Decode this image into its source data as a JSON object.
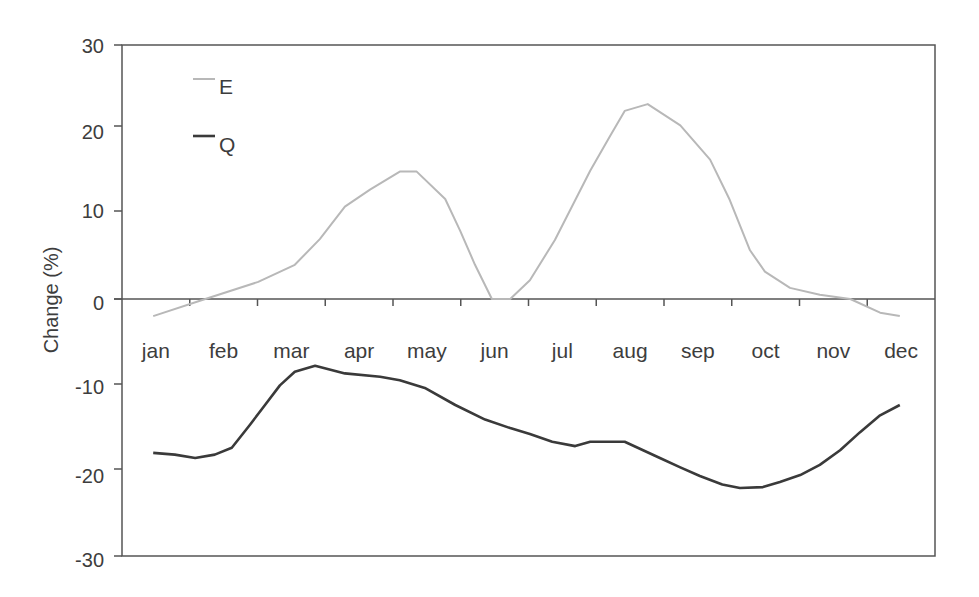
{
  "chart_data": {
    "type": "line",
    "title": "",
    "xlabel": "",
    "ylabel": "Change (%)",
    "ylim": [
      -30,
      30
    ],
    "yticks": [
      30,
      20,
      10,
      0,
      -10,
      -20,
      -30
    ],
    "categories": [
      "jan",
      "feb",
      "mar",
      "apr",
      "may",
      "jun",
      "jul",
      "aug",
      "sep",
      "oct",
      "nov",
      "dec"
    ],
    "x_unit": "month index (0 = start of jan, 12 = end of dec)",
    "xlim": [
      0,
      12
    ],
    "grid": false,
    "legend_position": "upper-left inside plot",
    "series": [
      {
        "name": "E",
        "color": "#b8b8b8",
        "x": [
          0.46,
          1.23,
          2.01,
          2.55,
          2.92,
          3.29,
          3.66,
          4.1,
          4.35,
          4.77,
          4.99,
          5.21,
          5.46,
          5.73,
          6.02,
          6.39,
          6.91,
          7.2,
          7.42,
          7.76,
          8.24,
          8.68,
          8.97,
          9.27,
          9.49,
          9.86,
          10.3,
          10.75,
          11.19,
          11.48
        ],
        "values": [
          -2.0,
          0.0,
          2.0,
          4.0,
          7.0,
          10.8,
          12.8,
          14.9,
          14.9,
          11.7,
          8.0,
          4.0,
          0.0,
          0.0,
          2.2,
          6.9,
          15.0,
          19.0,
          22.0,
          22.8,
          20.3,
          16.3,
          11.6,
          5.7,
          3.2,
          1.3,
          0.5,
          0.0,
          -1.6,
          -2.0
        ]
      },
      {
        "name": "Q",
        "color": "#3a3a3a",
        "x": [
          0.46,
          0.78,
          1.08,
          1.37,
          1.62,
          1.89,
          2.11,
          2.33,
          2.55,
          2.85,
          3.29,
          3.81,
          4.1,
          4.47,
          4.92,
          5.36,
          5.73,
          6.02,
          6.35,
          6.69,
          6.91,
          7.42,
          7.94,
          8.24,
          8.53,
          8.86,
          9.12,
          9.46,
          9.71,
          10.01,
          10.3,
          10.6,
          10.89,
          11.19,
          11.48
        ],
        "values": [
          -18.0,
          -18.2,
          -18.6,
          -18.2,
          -17.4,
          -14.7,
          -12.4,
          -10.1,
          -8.5,
          -7.8,
          -8.7,
          -9.1,
          -9.5,
          -10.4,
          -12.4,
          -14.1,
          -15.1,
          -15.8,
          -16.7,
          -17.2,
          -16.7,
          -16.7,
          -18.6,
          -19.7,
          -20.7,
          -21.7,
          -22.1,
          -22.0,
          -21.4,
          -20.6,
          -19.4,
          -17.7,
          -15.6,
          -13.6,
          -12.4
        ]
      }
    ]
  },
  "legend": {
    "items": [
      {
        "label": "E",
        "color": "#b8b8b8"
      },
      {
        "label": "Q",
        "color": "#3a3a3a"
      }
    ]
  },
  "axis": {
    "y_title": "Change (%)",
    "y_tick_labels": [
      "30",
      "20",
      "10",
      "0",
      "-10",
      "-20",
      "-30"
    ],
    "month_labels": [
      "jan",
      "feb",
      "mar",
      "apr",
      "may",
      "jun",
      "jul",
      "aug",
      "sep",
      "oct",
      "nov",
      "dec"
    ]
  }
}
